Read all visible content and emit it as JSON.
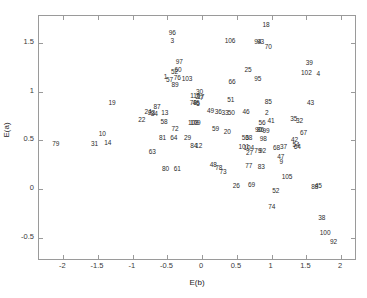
{
  "chart_data": {
    "type": "scatter",
    "title": "",
    "xlabel": "E(b)",
    "ylabel": "E(a)",
    "xlim": [
      -2.35,
      2.2
    ],
    "ylim": [
      -0.72,
      1.78
    ],
    "xticks": [
      -2,
      -1.5,
      -1,
      -0.5,
      0,
      0.5,
      1,
      1.5,
      2
    ],
    "xticklabels": [
      "-2",
      "-1.5",
      "-1",
      "-0.5",
      "0",
      "0.5",
      "1",
      "1.5",
      "2"
    ],
    "yticks": [
      -0.5,
      0,
      0.5,
      1,
      1.5
    ],
    "yticklabels": [
      "-0.5",
      "0",
      "0.5",
      "1",
      "1.5"
    ],
    "grid": false,
    "legend": null,
    "marker_style": "text-label",
    "points": [
      {
        "label": "18",
        "x": 0.92,
        "y": 1.69
      },
      {
        "label": "96",
        "x": -0.43,
        "y": 1.6
      },
      {
        "label": "3",
        "x": -0.43,
        "y": 1.52
      },
      {
        "label": "106",
        "x": 0.4,
        "y": 1.52
      },
      {
        "label": "94",
        "x": 0.8,
        "y": 1.51
      },
      {
        "label": "93",
        "x": 0.84,
        "y": 1.51
      },
      {
        "label": "70",
        "x": 0.95,
        "y": 1.46
      },
      {
        "label": "97",
        "x": -0.33,
        "y": 1.31
      },
      {
        "label": "39",
        "x": 1.54,
        "y": 1.3
      },
      {
        "label": "60",
        "x": -0.35,
        "y": 1.22
      },
      {
        "label": "52",
        "x": -0.4,
        "y": 1.2
      },
      {
        "label": "25",
        "x": 0.66,
        "y": 1.22
      },
      {
        "label": "102",
        "x": 1.5,
        "y": 1.19
      },
      {
        "label": "4",
        "x": 1.67,
        "y": 1.18
      },
      {
        "label": "1",
        "x": -0.53,
        "y": 1.15
      },
      {
        "label": "76",
        "x": -0.36,
        "y": 1.14
      },
      {
        "label": "103",
        "x": -0.22,
        "y": 1.13
      },
      {
        "label": "57",
        "x": -0.47,
        "y": 1.12
      },
      {
        "label": "95",
        "x": 0.8,
        "y": 1.13
      },
      {
        "label": "66",
        "x": 0.43,
        "y": 1.1
      },
      {
        "label": "89",
        "x": -0.39,
        "y": 1.07
      },
      {
        "label": "30",
        "x": -0.04,
        "y": 1.0
      },
      {
        "label": "110",
        "x": -0.1,
        "y": 0.96
      },
      {
        "label": "2",
        "x": -0.07,
        "y": 0.95
      },
      {
        "label": "17",
        "x": -0.02,
        "y": 0.95
      },
      {
        "label": "7",
        "x": -0.01,
        "y": 0.94
      },
      {
        "label": "51",
        "x": 0.41,
        "y": 0.92
      },
      {
        "label": "19",
        "x": -1.3,
        "y": 0.88
      },
      {
        "label": "78",
        "x": -0.13,
        "y": 0.88
      },
      {
        "label": "46",
        "x": -0.09,
        "y": 0.88
      },
      {
        "label": "5",
        "x": -0.06,
        "y": 0.87
      },
      {
        "label": "85",
        "x": 0.95,
        "y": 0.9
      },
      {
        "label": "43",
        "x": 1.56,
        "y": 0.88
      },
      {
        "label": "87",
        "x": -0.65,
        "y": 0.84
      },
      {
        "label": "49",
        "x": 0.12,
        "y": 0.8
      },
      {
        "label": "36",
        "x": 0.23,
        "y": 0.79
      },
      {
        "label": "33",
        "x": 0.33,
        "y": 0.78
      },
      {
        "label": "50",
        "x": 0.42,
        "y": 0.78
      },
      {
        "label": "46b",
        "x": 0.63,
        "y": 0.79
      },
      {
        "label": "2b",
        "x": 0.93,
        "y": 0.78
      },
      {
        "label": "24",
        "x": -0.78,
        "y": 0.79
      },
      {
        "label": "23",
        "x": -0.73,
        "y": 0.78
      },
      {
        "label": "84",
        "x": -0.69,
        "y": 0.77
      },
      {
        "label": "13",
        "x": -0.54,
        "y": 0.78
      },
      {
        "label": "22",
        "x": -0.87,
        "y": 0.71
      },
      {
        "label": "35",
        "x": 1.32,
        "y": 0.72
      },
      {
        "label": "32",
        "x": 1.4,
        "y": 0.7
      },
      {
        "label": "58",
        "x": -0.55,
        "y": 0.69
      },
      {
        "label": "108",
        "x": -0.13,
        "y": 0.68
      },
      {
        "label": "109",
        "x": -0.1,
        "y": 0.68
      },
      {
        "label": "56",
        "x": 0.86,
        "y": 0.68
      },
      {
        "label": "41",
        "x": 0.99,
        "y": 0.7
      },
      {
        "label": "72",
        "x": -0.39,
        "y": 0.62
      },
      {
        "label": "59",
        "x": 0.19,
        "y": 0.62
      },
      {
        "label": "20",
        "x": 0.36,
        "y": 0.59
      },
      {
        "label": "90",
        "x": 0.81,
        "y": 0.61
      },
      {
        "label": "86",
        "x": 0.84,
        "y": 0.61
      },
      {
        "label": "99",
        "x": 0.92,
        "y": 0.6
      },
      {
        "label": "10",
        "x": -1.44,
        "y": 0.57
      },
      {
        "label": "67",
        "x": 1.46,
        "y": 0.58
      },
      {
        "label": "81",
        "x": -0.57,
        "y": 0.53
      },
      {
        "label": "64",
        "x": -0.41,
        "y": 0.52
      },
      {
        "label": "29",
        "x": -0.21,
        "y": 0.52
      },
      {
        "label": "53",
        "x": 0.62,
        "y": 0.52
      },
      {
        "label": "68",
        "x": 0.67,
        "y": 0.52
      },
      {
        "label": "98",
        "x": 0.88,
        "y": 0.51
      },
      {
        "label": "42",
        "x": 1.33,
        "y": 0.5
      },
      {
        "label": "31",
        "x": -1.55,
        "y": 0.46
      },
      {
        "label": "14",
        "x": -1.36,
        "y": 0.47
      },
      {
        "label": "84b",
        "x": -0.12,
        "y": 0.44
      },
      {
        "label": "12",
        "x": -0.05,
        "y": 0.44
      },
      {
        "label": "101",
        "x": 0.6,
        "y": 0.43
      },
      {
        "label": "104",
        "x": 0.67,
        "y": 0.42
      },
      {
        "label": "54",
        "x": 1.35,
        "y": 0.45
      },
      {
        "label": "64b",
        "x": 1.37,
        "y": 0.43
      },
      {
        "label": "79",
        "x": -2.11,
        "y": 0.46
      },
      {
        "label": "37",
        "x": 1.17,
        "y": 0.43
      },
      {
        "label": "68b",
        "x": 1.07,
        "y": 0.42
      },
      {
        "label": "27",
        "x": 0.68,
        "y": 0.37
      },
      {
        "label": "79b",
        "x": 0.8,
        "y": 0.39
      },
      {
        "label": "92",
        "x": 0.87,
        "y": 0.39
      },
      {
        "label": "63",
        "x": -0.72,
        "y": 0.38
      },
      {
        "label": "47",
        "x": 1.13,
        "y": 0.33
      },
      {
        "label": "9",
        "x": 1.14,
        "y": 0.28
      },
      {
        "label": "48",
        "x": 0.16,
        "y": 0.25
      },
      {
        "label": "78b",
        "x": 0.24,
        "y": 0.22
      },
      {
        "label": "77",
        "x": 0.67,
        "y": 0.24
      },
      {
        "label": "83",
        "x": 0.85,
        "y": 0.23
      },
      {
        "label": "80",
        "x": -0.53,
        "y": 0.21
      },
      {
        "label": "61",
        "x": -0.36,
        "y": 0.21
      },
      {
        "label": "73",
        "x": 0.3,
        "y": 0.17
      },
      {
        "label": "105",
        "x": 1.22,
        "y": 0.12
      },
      {
        "label": "26",
        "x": 0.49,
        "y": 0.03
      },
      {
        "label": "69",
        "x": 0.71,
        "y": 0.04
      },
      {
        "label": "88",
        "x": 1.62,
        "y": 0.02
      },
      {
        "label": "45",
        "x": 1.67,
        "y": 0.03
      },
      {
        "label": "52b",
        "x": 1.06,
        "y": -0.02
      },
      {
        "label": "74",
        "x": 1.0,
        "y": -0.18
      },
      {
        "label": "38",
        "x": 1.72,
        "y": -0.3
      },
      {
        "label": "100",
        "x": 1.77,
        "y": -0.45
      },
      {
        "label": "92b",
        "x": 1.89,
        "y": -0.55
      }
    ]
  },
  "labels_display": {
    "18": "18",
    "96": "96",
    "3": "3",
    "106": "106",
    "94": "94",
    "93": "93",
    "70": "70",
    "97": "97",
    "39": "39",
    "60": "60",
    "52": "52",
    "25": "25",
    "102": "102",
    "4": "4",
    "1": "1",
    "76": "76",
    "103": "103",
    "57": "57",
    "95": "95",
    "66": "66",
    "89": "89",
    "30": "30",
    "110": "110",
    "2": "2",
    "17": "17",
    "7": "7",
    "51": "51",
    "19": "19",
    "78": "78",
    "46": "46",
    "5": "5",
    "85": "85",
    "43": "43",
    "87": "87",
    "49": "49",
    "36": "36",
    "33": "33",
    "50": "50",
    "46b": "46",
    "2b": "2",
    "24": "24",
    "23": "23",
    "84": "84",
    "13": "13",
    "22": "22",
    "35": "35",
    "32": "32",
    "58": "58",
    "108": "108",
    "109": "109",
    "56": "56",
    "41": "41",
    "72": "72",
    "59": "59",
    "20": "20",
    "90": "90",
    "86": "86",
    "99": "99",
    "10": "10",
    "67": "67",
    "81": "81",
    "64": "64",
    "29": "29",
    "53": "53",
    "68": "68",
    "98": "98",
    "42": "42",
    "31": "31",
    "14": "14",
    "84b": "84",
    "12": "12",
    "101": "101",
    "104": "104",
    "54": "54",
    "64b": "64",
    "79": "79",
    "37": "37",
    "68b": "68",
    "27": "27",
    "79b": "79",
    "92": "92",
    "63": "63",
    "47": "47",
    "9": "9",
    "48": "48",
    "78b": "78",
    "77": "77",
    "83": "83",
    "80": "80",
    "61": "61",
    "73": "73",
    "105": "105",
    "26": "26",
    "69": "69",
    "88": "88",
    "45": "45",
    "52b": "52",
    "74": "74",
    "38": "38",
    "100": "100",
    "92b": "92"
  },
  "style": {
    "axis_color": "#9a9a9a",
    "text_color": "#2b2b2b",
    "background": "#ffffff"
  }
}
